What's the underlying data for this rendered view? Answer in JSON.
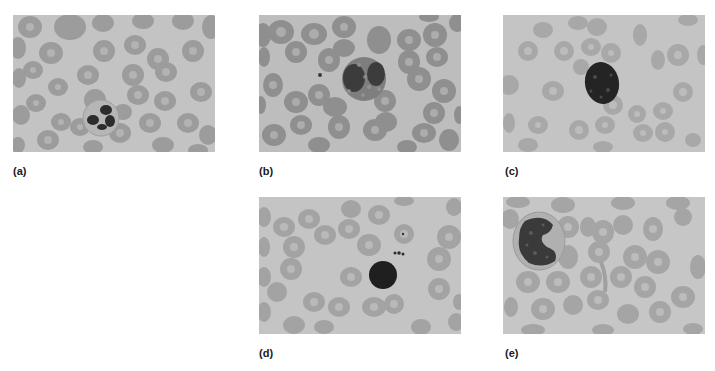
{
  "figure": {
    "background": "#ffffff",
    "panels": [
      {
        "id": "a",
        "label": "(a)",
        "cell_type": "neutrophil",
        "x": 13,
        "y": 15
      },
      {
        "id": "b",
        "label": "(b)",
        "cell_type": "eosinophil",
        "x": 259,
        "y": 15
      },
      {
        "id": "c",
        "label": "(c)",
        "cell_type": "basophil",
        "x": 503,
        "y": 15
      },
      {
        "id": "d",
        "label": "(d)",
        "cell_type": "lymphocyte",
        "x": 259,
        "y": 197
      },
      {
        "id": "e",
        "label": "(e)",
        "cell_type": "monocyte",
        "x": 503,
        "y": 197
      }
    ],
    "colors": {
      "background_field": "#c2c2c2",
      "red_blood_cell": "#9a9a9a",
      "red_blood_cell_center": "#b4b4b4",
      "nucleus": "#2a2a2a",
      "label_text": "#1a1a1a"
    }
  }
}
